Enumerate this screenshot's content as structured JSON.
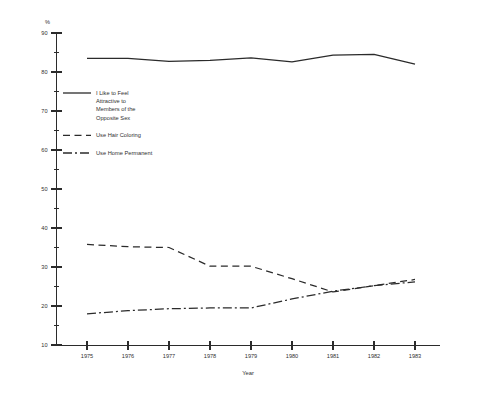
{
  "chart_data": {
    "type": "line",
    "title": "",
    "subtitle": "",
    "xlabel": "Year",
    "ylabel": "",
    "unit_label": "%",
    "x": [
      1975,
      1976,
      1977,
      1978,
      1979,
      1980,
      1981,
      1982,
      1983
    ],
    "xticklabels": [
      "1975",
      "1976",
      "1977",
      "1978",
      "1979",
      "1980",
      "1981",
      "1982",
      "1983"
    ],
    "xlim": [
      1975,
      1983
    ],
    "ylim": [
      10,
      90
    ],
    "yticks": [
      10,
      20,
      30,
      40,
      50,
      60,
      70,
      80,
      90
    ],
    "yticklabels": [
      "10",
      "20",
      "30",
      "40",
      "50",
      "60",
      "70",
      "80",
      "90"
    ],
    "yminorticks": [
      15,
      25,
      35,
      45,
      55,
      65,
      75,
      85
    ],
    "grid": false,
    "legend_position": "upper-left-inside",
    "series": [
      {
        "name": "I Like to Feel Attractive to Members of the Opposite Sex",
        "style": "solid",
        "values": [
          83.5,
          83.5,
          82.7,
          83.0,
          83.6,
          82.6,
          84.3,
          84.5,
          82.0
        ]
      },
      {
        "name": "Use Hair Coloring",
        "style": "dashed",
        "values": [
          35.8,
          35.2,
          35.0,
          30.2,
          30.2,
          27.0,
          23.6,
          25.2,
          26.8
        ]
      },
      {
        "name": "Use Home Permanent",
        "style": "dashdot",
        "values": [
          18.0,
          18.8,
          19.3,
          19.5,
          19.5,
          21.8,
          23.8,
          25.2,
          26.2
        ]
      }
    ]
  },
  "legend": {
    "items": [
      {
        "label_lines": [
          "I Like to Feel",
          "Attractive to",
          "Members of the",
          "Opposite Sex"
        ],
        "style": "solid"
      },
      {
        "label_lines": [
          "Use Hair Coloring"
        ],
        "style": "dashed"
      },
      {
        "label_lines": [
          "Use Home Permanent"
        ],
        "style": "dashdot"
      }
    ]
  }
}
